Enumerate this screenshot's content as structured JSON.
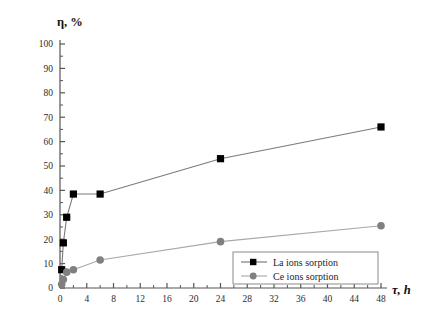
{
  "chart_data": {
    "type": "line",
    "title": "",
    "subtitle": "",
    "xlabel": "τ, h",
    "ylabel": "η, %",
    "xlim": [
      0,
      48
    ],
    "ylim": [
      0,
      100
    ],
    "xticks": [
      0,
      4,
      8,
      12,
      16,
      20,
      24,
      28,
      32,
      36,
      40,
      44,
      48
    ],
    "xtick_labels": [
      "0",
      "4",
      "8",
      "12",
      "16",
      "20",
      "24",
      "28",
      "32",
      "36",
      "40",
      "44",
      "48"
    ],
    "yticks": [
      0,
      10,
      20,
      30,
      40,
      50,
      60,
      70,
      80,
      90,
      100
    ],
    "ytick_labels": [
      "0",
      "10",
      "20",
      "30",
      "40",
      "50",
      "60",
      "70",
      "80",
      "90",
      "100"
    ],
    "minor_tick_step_x": 2,
    "minor_tick_step_y": 5,
    "grid": false,
    "legend_position": "bottom-right",
    "series": [
      {
        "name": "La ions sorption",
        "marker": "square",
        "color": "#000000",
        "line_color": "#7a7a7a",
        "x": [
          0.25,
          0.5,
          1,
          2,
          6,
          24,
          48
        ],
        "y": [
          7.5,
          18.5,
          29,
          38.5,
          38.5,
          53,
          66
        ]
      },
      {
        "name": "Ce ions sorption",
        "marker": "circle",
        "color": "#808080",
        "line_color": "#a8a8a8",
        "x": [
          0.25,
          0.5,
          1,
          2,
          6,
          24,
          48
        ],
        "y": [
          1.5,
          3.5,
          6.5,
          7.5,
          11.5,
          19,
          25.5
        ]
      }
    ],
    "legend": [
      {
        "label": "La ions sorption",
        "marker": "square",
        "color": "#000000"
      },
      {
        "label": "Ce ions sorption",
        "marker": "circle",
        "color": "#808080"
      }
    ]
  },
  "axes": {
    "y_label": "η, %",
    "x_label": "τ, h"
  },
  "colors": {
    "axis": "#555555",
    "background": "#ffffff",
    "series_la": "#000000",
    "series_ce": "#808080",
    "legend_border": "#8a8a8a"
  }
}
